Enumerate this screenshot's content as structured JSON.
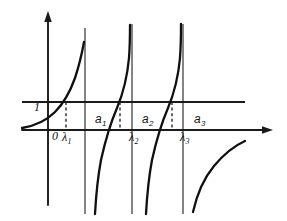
{
  "figure": {
    "title": "",
    "axis_labels": {
      "origin": "0",
      "unit_level": "1"
    },
    "asymptote_labels": [
      "a",
      "a",
      "a"
    ],
    "asymptote_subscripts": [
      "1",
      "2",
      "3"
    ],
    "root_labels": [
      "λ",
      "λ",
      "λ"
    ],
    "root_subscripts": [
      "1",
      "2",
      "3"
    ],
    "colors": {
      "curve": "#101010",
      "axis": "#1a1a1a",
      "asymptote": "#3a3a3a",
      "background": "#ffffff"
    }
  },
  "chart_data": {
    "type": "line",
    "title": "",
    "xlabel": "",
    "ylabel": "",
    "grid": false,
    "legend": null,
    "xlim": [
      0,
      287
    ],
    "ylim": [
      221,
      0
    ],
    "axes": {
      "x_axis_y_pixel": 130,
      "y_axis_x_pixel": 48,
      "x_axis_arrow_tip": [
        272,
        130
      ],
      "y_axis_arrow_tip": [
        48,
        12
      ]
    },
    "horizontal_level": {
      "label": "1",
      "y_pixel": 102,
      "x_start": 22,
      "x_end": 245
    },
    "vertical_asymptotes": [
      {
        "label": "a",
        "subscript": "1",
        "x_pixel": 85,
        "y_top": 28,
        "y_bottom": 214
      },
      {
        "label": "a",
        "subscript": "2",
        "x_pixel": 132,
        "y_top": 24,
        "y_bottom": 214
      },
      {
        "label": "a",
        "subscript": "3",
        "x_pixel": 183,
        "y_top": 24,
        "y_bottom": 214
      }
    ],
    "intersections": [
      {
        "label": "λ",
        "subscript": "1",
        "x_pixel": 66,
        "y_pixel": 102
      },
      {
        "label": "λ",
        "subscript": "2",
        "x_pixel": 120,
        "y_pixel": 102
      },
      {
        "label": "λ",
        "subscript": "3",
        "x_pixel": 172,
        "y_pixel": 102
      }
    ],
    "dashed_drops": [
      {
        "x_pixel": 66,
        "y_top": 102,
        "y_bottom": 130
      },
      {
        "x_pixel": 120,
        "y_top": 102,
        "y_bottom": 130
      },
      {
        "x_pixel": 172,
        "y_top": 102,
        "y_bottom": 130
      }
    ],
    "branches": [
      {
        "name": "branch-0",
        "path": "M 22,128 C 34,126 46,121 55,112 C 63,104 70,92 75,78 C 79,66 82,53 84,42"
      },
      {
        "name": "branch-1",
        "path": "M 95,214 C 96,196 98,176 101,160 C 105,142 111,122 117,108 C 122,96 127,80 129,58 C 130,44 130,34 130,25"
      },
      {
        "name": "branch-2",
        "path": "M 146,214 C 147,196 149,176 152,160 C 156,142 162,122 168,108 C 173,96 178,80 180,58 C 181,44 181,34 181,24"
      },
      {
        "name": "branch-3",
        "path": "M 193,212 C 197,194 204,178 214,166 C 224,154 236,145 245,141"
      }
    ]
  }
}
